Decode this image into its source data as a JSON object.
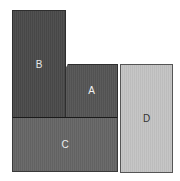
{
  "diagram": {
    "type": "block-partition",
    "blocks": [
      {
        "id": "B",
        "label": "B",
        "color": "#4a4a4a",
        "text_color": "#e8e8e8"
      },
      {
        "id": "A",
        "label": "A",
        "color": "#555555",
        "text_color": "#f0f0f0"
      },
      {
        "id": "C",
        "label": "C",
        "color": "#666666",
        "text_color": "#eeeeee"
      },
      {
        "id": "D",
        "label": "D",
        "color": "#c4c4c4",
        "text_color": "#333333"
      }
    ]
  }
}
